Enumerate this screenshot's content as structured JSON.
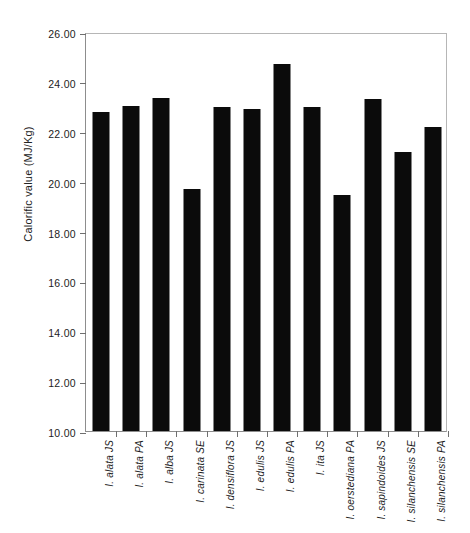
{
  "chart_data": {
    "type": "bar",
    "title": "",
    "xlabel": "",
    "ylabel": "Calorific value (MJ/Kg)",
    "ylim": [
      10.0,
      26.0
    ],
    "ytick_step": 2.0,
    "ytick_labels": [
      "26.00",
      "24.00",
      "22.00",
      "20.00",
      "18.00",
      "16.00",
      "14.00",
      "12.00",
      "10.00"
    ],
    "ytick_values": [
      26.0,
      24.0,
      22.0,
      20.0,
      18.0,
      16.0,
      14.0,
      12.0,
      10.0
    ],
    "grid": false,
    "legend": false,
    "bar_color": "#0b0b0b",
    "axis_color": "#8d8d8d",
    "categories": [
      "I. alata JS",
      "I. alata PA",
      "I. alba JS",
      "I. carinata SE",
      "I. densiflora JS",
      "I. edulis JS",
      "I. edulis PA",
      "I. ita JS",
      "I. oerstediana PA",
      "I. sapindoides JS",
      "I. silanchensis SE",
      "I. silanchensis PA"
    ],
    "values": [
      22.8,
      23.05,
      23.35,
      19.7,
      23.0,
      22.9,
      24.7,
      23.0,
      19.45,
      23.3,
      21.2,
      22.2
    ]
  }
}
